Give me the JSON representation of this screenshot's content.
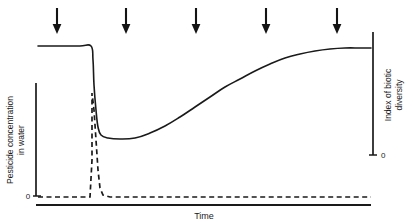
{
  "chart_data": {
    "type": "line",
    "title": "",
    "xlabel": "Time",
    "ylabel_left": "Pesticide concentration in water",
    "ylabel_left_line1": "Pesticide concentration",
    "ylabel_left_line2": "in water",
    "ylabel_right": "Index of biotic diversity",
    "ylabel_right_line1": "Index of biotic",
    "ylabel_right_line2": "diversity",
    "left_axis_ticks": [
      "0"
    ],
    "right_axis_ticks": [
      "0"
    ],
    "grid": false,
    "legend": null,
    "xlim": [
      0,
      100
    ],
    "ylim_left": [
      0,
      100
    ],
    "ylim_right": [
      0,
      100
    ],
    "annotations": {
      "arrow_label": "pesticide application",
      "arrow_count": 5,
      "arrow_x_positions": [
        57,
        126,
        196,
        266,
        337
      ]
    },
    "series": [
      {
        "name": "Index of biotic diversity",
        "style": "solid",
        "axis": "right",
        "color": "#1a1a1a",
        "points": [
          [
            38,
            46
          ],
          [
            60,
            46
          ],
          [
            80,
            46
          ],
          [
            91,
            46
          ],
          [
            93,
            60
          ],
          [
            94,
            85
          ],
          [
            96,
            110
          ],
          [
            98,
            127
          ],
          [
            101,
            135
          ],
          [
            108,
            138
          ],
          [
            120,
            139
          ],
          [
            135,
            138
          ],
          [
            150,
            133
          ],
          [
            165,
            126
          ],
          [
            180,
            117
          ],
          [
            195,
            107
          ],
          [
            210,
            97
          ],
          [
            225,
            87
          ],
          [
            240,
            79
          ],
          [
            255,
            71
          ],
          [
            270,
            64
          ],
          [
            285,
            58
          ],
          [
            300,
            54
          ],
          [
            315,
            51
          ],
          [
            330,
            49
          ],
          [
            345,
            48
          ],
          [
            360,
            48
          ],
          [
            371,
            48
          ]
        ]
      },
      {
        "name": "Pesticide concentration in water",
        "style": "dashed",
        "axis": "left",
        "color": "#1a1a1a",
        "points": [
          [
            38,
            197
          ],
          [
            60,
            197
          ],
          [
            80,
            197
          ],
          [
            90,
            197
          ],
          [
            92,
            160
          ],
          [
            92,
            120
          ],
          [
            92,
            93
          ],
          [
            94,
            110
          ],
          [
            96,
            140
          ],
          [
            98,
            170
          ],
          [
            100,
            188
          ],
          [
            103,
            195
          ],
          [
            110,
            197
          ],
          [
            140,
            197
          ],
          [
            200,
            197
          ],
          [
            280,
            197
          ],
          [
            340,
            197
          ],
          [
            371,
            197
          ]
        ]
      }
    ]
  },
  "axes": {
    "left": {
      "x": 36,
      "y_top": 83,
      "y_bottom": 196,
      "tick_zero_label": "0"
    },
    "right": {
      "x": 373,
      "y_top": 32,
      "y_bottom": 155,
      "tick_zero_label": "0"
    },
    "bottom": {
      "y": 205,
      "x_start": 36,
      "x_end": 371
    }
  },
  "colors": {
    "line": "#1a1a1a",
    "axis": "#1a1a1a",
    "background": "#ffffff",
    "text": "#1a1a1a"
  }
}
